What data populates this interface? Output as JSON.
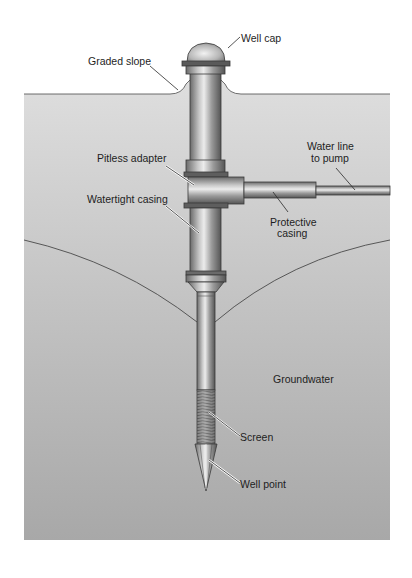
{
  "figure": {
    "type": "diagram",
    "labels": {
      "well_cap": "Well cap",
      "graded_slope": "Graded slope",
      "pitless_adapter": "Pitless adapter",
      "water_line_1": "Water line",
      "water_line_2": "to pump",
      "watertight_casing": "Watertight casing",
      "protective_casing_1": "Protective",
      "protective_casing_2": "casing",
      "groundwater": "Groundwater",
      "screen": "Screen",
      "well_point": "Well point"
    },
    "colors": {
      "background": "#ffffff",
      "ground_top": "#dcdcdc",
      "ground_bottom": "#a9a9a9",
      "pipe_dark": "#5a5a5a",
      "pipe_light": "#e6e6e6",
      "outline": "#3a3a3a",
      "text": "#1e1e1e"
    }
  }
}
